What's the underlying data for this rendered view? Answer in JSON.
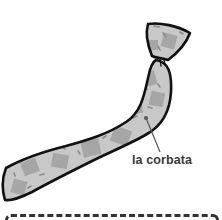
{
  "illustration": {
    "subject": "necktie",
    "label": "la corbata",
    "colors": {
      "outline": "#111111",
      "fabric": "#c8c8c8",
      "patch": "#a6a6a6",
      "stitch": "#8a8a8a",
      "leader_line": "#555555",
      "label_text": "#3a3a3a"
    }
  }
}
